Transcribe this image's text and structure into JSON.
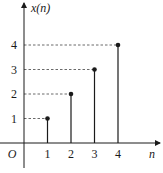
{
  "chart_data": {
    "type": "stem",
    "title": "",
    "xlabel": "n",
    "ylabel": "x(n)",
    "origin_label": "O",
    "x": [
      1,
      2,
      3,
      4
    ],
    "values": [
      1,
      2,
      3,
      4
    ],
    "x_tick_labels": [
      "1",
      "2",
      "3",
      "4"
    ],
    "y_tick_labels": [
      "1",
      "2",
      "3",
      "4"
    ],
    "grid": false,
    "guide_lines": "dashed horizontal lines from y-axis to each point",
    "legend": null
  },
  "colors": {
    "ink": "#1a1a1a",
    "dash": "#444444",
    "background": "#ffffff"
  }
}
